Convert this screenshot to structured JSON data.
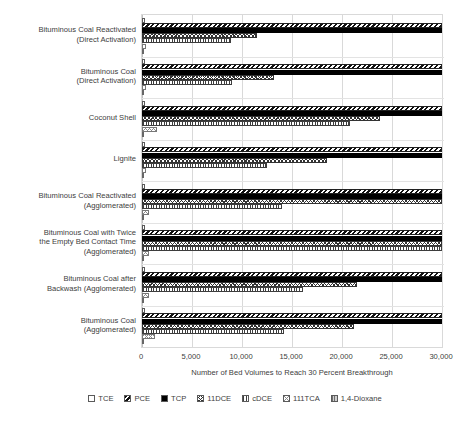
{
  "chart_data": {
    "type": "bar",
    "orientation": "horizontal",
    "title": "",
    "xlabel": "Number of Bed Volumes to Reach 30 Percent Breakthrough",
    "ylabel": "",
    "xlim": [
      0,
      30000
    ],
    "xticks": [
      0,
      5000,
      10000,
      15000,
      20000,
      25000,
      30000
    ],
    "xticklabels": [
      "0",
      "5,000",
      "10,000",
      "15,000",
      "20,000",
      "25,000",
      "30,000"
    ],
    "grid": true,
    "legend_position": "bottom",
    "categories": [
      "Bituminous Coal Reactivated (Direct Activation)",
      "Bituminous Coal (Direct Activation)",
      "Coconut Shell",
      "Lignite",
      "Bituminous Coal Reactivated (Agglomerated)",
      "Bituminous Coal with Twice the Empty Bed Contact Time (Agglomerated)",
      "Bituminous Coal after Backwash (Agglomerated)",
      "Bituminous Coal (Agglomerated)"
    ],
    "category_lines": [
      [
        "Bituminous Coal Reactivated",
        "(Direct Activation)"
      ],
      [
        "Bituminous Coal",
        "(Direct Activation)"
      ],
      [
        "Coconut Shell"
      ],
      [
        "Lignite"
      ],
      [
        "Bituminous Coal Reactivated",
        "(Agglomerated)"
      ],
      [
        "Bituminous Coal with Twice",
        "the Empty Bed Contact Time",
        "(Agglomerated)"
      ],
      [
        "Bituminous Coal after",
        "Backwash (Agglomerated)"
      ],
      [
        "Bituminous Coal",
        "(Agglomerated)"
      ]
    ],
    "series": [
      {
        "name": "TCE",
        "pattern": "p-tce",
        "values": [
          300,
          300,
          300,
          300,
          300,
          300,
          300,
          300
        ]
      },
      {
        "name": "PCE",
        "pattern": "p-pce",
        "values": [
          30000,
          30000,
          30000,
          30000,
          30000,
          30000,
          30000,
          30000
        ]
      },
      {
        "name": "TCP",
        "pattern": "p-tcp",
        "values": [
          30000,
          30000,
          30000,
          30000,
          30000,
          30000,
          30000,
          30000
        ]
      },
      {
        "name": "11DCE",
        "pattern": "p-11dce",
        "values": [
          11500,
          13200,
          23800,
          18500,
          30000,
          30000,
          21500,
          21200
        ]
      },
      {
        "name": "cDCE",
        "pattern": "p-cdce",
        "values": [
          8900,
          9000,
          20800,
          12500,
          14000,
          30000,
          16100,
          14200
        ]
      },
      {
        "name": "111TCA",
        "pattern": "p-111tca",
        "values": [
          400,
          400,
          1500,
          400,
          700,
          700,
          700,
          1300
        ]
      },
      {
        "name": "1,4-Dioxane",
        "pattern": "p-dioxane",
        "values": [
          0,
          0,
          0,
          0,
          0,
          0,
          0,
          0
        ]
      }
    ]
  },
  "legend": {
    "items": [
      {
        "label": "TCE",
        "swatch": "p-tce"
      },
      {
        "label": "PCE",
        "swatch": "p-pce"
      },
      {
        "label": "TCP",
        "swatch": "p-tcp"
      },
      {
        "label": "11DCE",
        "swatch": "p-11dce"
      },
      {
        "label": "cDCE",
        "swatch": "p-cdce"
      },
      {
        "label": "111TCA",
        "swatch": "p-111tca"
      },
      {
        "label": "1,4-Dioxane",
        "swatch": "p-dioxane"
      }
    ]
  }
}
